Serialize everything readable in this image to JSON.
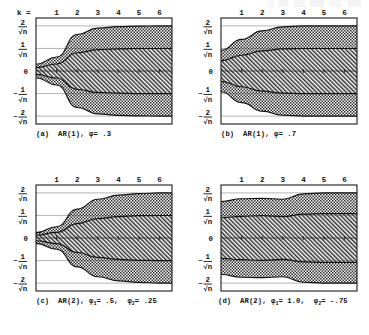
{
  "figure": {
    "title": "",
    "x_axis_prefix": "k =",
    "x_ticks": [
      "1",
      "2",
      "3",
      "4",
      "5",
      "6"
    ],
    "y_ticks": [
      {
        "label": "2/√n",
        "numerator": "2",
        "denominator": "√n",
        "sign": "",
        "value": 2
      },
      {
        "label": "1/√n",
        "numerator": "1",
        "denominator": "√n",
        "sign": "",
        "value": 1
      },
      {
        "label": "0",
        "numerator": "0",
        "denominator": "",
        "sign": "",
        "value": 0
      },
      {
        "label": "-1/√n",
        "numerator": "1",
        "denominator": "√n",
        "sign": "−",
        "value": -1
      },
      {
        "label": "-2/√n",
        "numerator": "2",
        "denominator": "√n",
        "sign": "−",
        "value": -2
      }
    ],
    "ylim": [
      -2.35,
      2.35
    ],
    "xlim": [
      0,
      6.6
    ],
    "legend": [],
    "colors": {
      "frame": "#1a1a1a",
      "curve": "#111111",
      "gridline": "#555555",
      "outer_fill": "#9a9a9a",
      "inner_fill": "#b4b4b4",
      "background": "#ffffff"
    }
  },
  "chart_data": {
    "type": "area",
    "xlabel": "k",
    "ylabel": "standard error units (1/√n)",
    "xlim": [
      0,
      6.6
    ],
    "ylim": [
      -2.35,
      2.35
    ],
    "grid": true,
    "x": [
      1,
      2,
      3,
      4,
      5,
      6
    ],
    "panels": [
      {
        "id": "a",
        "label": "(a)",
        "model": "AR(1)",
        "caption": "(a)   AR(1), φ = .3",
        "params": [
          {
            "symbol": "φ",
            "subscript": "",
            "value": ".3"
          }
        ],
        "series": [
          {
            "name": "upper 2-sigma band",
            "values": [
              0.62,
              1.62,
              1.9,
              1.97,
              1.99,
              2.0
            ]
          },
          {
            "name": "upper 1-sigma band",
            "values": [
              0.31,
              0.81,
              0.95,
              0.98,
              1.0,
              1.0
            ]
          },
          {
            "name": "mean",
            "values": [
              0.0,
              0.0,
              0.0,
              0.0,
              0.0,
              0.0
            ]
          },
          {
            "name": "lower 1-sigma band",
            "values": [
              -0.31,
              -0.81,
              -0.95,
              -0.98,
              -1.0,
              -1.0
            ]
          },
          {
            "name": "lower 2-sigma band",
            "values": [
              -0.62,
              -1.62,
              -1.9,
              -1.97,
              -1.99,
              -2.0
            ]
          }
        ]
      },
      {
        "id": "b",
        "label": "(b)",
        "model": "AR(1)",
        "caption": "(b)   AR(1), φ = .7",
        "params": [
          {
            "symbol": "φ",
            "subscript": "",
            "value": ".7"
          }
        ],
        "series": [
          {
            "name": "upper 2-sigma band",
            "values": [
              1.4,
              1.78,
              1.96,
              2.0,
              2.0,
              2.0
            ]
          },
          {
            "name": "upper 1-sigma band",
            "values": [
              0.7,
              0.89,
              0.98,
              1.0,
              1.0,
              1.0
            ]
          },
          {
            "name": "mean",
            "values": [
              0.0,
              0.0,
              0.0,
              0.0,
              0.0,
              0.0
            ]
          },
          {
            "name": "lower 1-sigma band",
            "values": [
              -0.7,
              -0.89,
              -0.98,
              -1.0,
              -1.0,
              -1.0
            ]
          },
          {
            "name": "lower 2-sigma band",
            "values": [
              -1.4,
              -1.78,
              -1.96,
              -2.0,
              -2.0,
              -2.0
            ]
          }
        ]
      },
      {
        "id": "c",
        "label": "(c)",
        "model": "AR(2)",
        "caption": "(c)   AR(2), φ₁ = .5, φ₂ = .25",
        "params": [
          {
            "symbol": "φ",
            "subscript": "1",
            "value": ".5"
          },
          {
            "symbol": "φ",
            "subscript": "2",
            "value": ".25"
          }
        ],
        "series": [
          {
            "name": "upper 2-sigma band",
            "values": [
              0.5,
              1.28,
              1.72,
              1.9,
              1.97,
              2.0
            ]
          },
          {
            "name": "upper 1-sigma band",
            "values": [
              0.25,
              0.64,
              0.86,
              0.95,
              0.99,
              1.0
            ]
          },
          {
            "name": "mean",
            "values": [
              0.0,
              0.0,
              0.0,
              0.0,
              0.0,
              0.0
            ]
          },
          {
            "name": "lower 1-sigma band",
            "values": [
              -0.25,
              -0.64,
              -0.86,
              -0.95,
              -0.99,
              -1.0
            ]
          },
          {
            "name": "lower 2-sigma band",
            "values": [
              -0.5,
              -1.28,
              -1.72,
              -1.9,
              -1.97,
              -2.0
            ]
          }
        ]
      },
      {
        "id": "d",
        "label": "(d)",
        "model": "AR(2)",
        "caption": "(d)  AR(2), φ₁ = 1.0, φ₂ = -.75",
        "params": [
          {
            "symbol": "φ",
            "subscript": "1",
            "value": "1.0"
          },
          {
            "symbol": "φ",
            "subscript": "2",
            "value": "-.75"
          }
        ],
        "series": [
          {
            "name": "upper 2-sigma band",
            "values": [
              1.74,
              1.76,
              1.72,
              1.96,
              2.0,
              2.0
            ]
          },
          {
            "name": "upper 1-sigma band",
            "values": [
              0.96,
              0.99,
              0.95,
              1.06,
              1.08,
              1.08
            ]
          },
          {
            "name": "mean",
            "values": [
              0.0,
              0.0,
              0.0,
              0.0,
              0.0,
              0.0
            ]
          },
          {
            "name": "lower 1-sigma band",
            "values": [
              -0.96,
              -0.99,
              -0.95,
              -1.06,
              -1.08,
              -1.08
            ]
          },
          {
            "name": "lower 2-sigma band",
            "values": [
              -1.74,
              -1.76,
              -1.72,
              -1.96,
              -2.0,
              -2.0
            ]
          }
        ]
      }
    ]
  }
}
